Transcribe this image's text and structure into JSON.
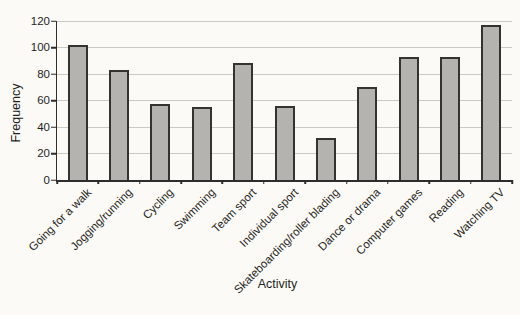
{
  "figure": {
    "background": "#fbfaf6"
  },
  "chart_data": {
    "type": "bar",
    "title": "",
    "categories": [
      "Going for a walk",
      "Jogging/running",
      "Cycling",
      "Swimming",
      "Team sport",
      "Individual sport",
      "Skateboarding/roller blading",
      "Dance or drama",
      "Computer games",
      "Reading",
      "Watching TV"
    ],
    "values": [
      102,
      83,
      57,
      55,
      88,
      56,
      32,
      70,
      93,
      93,
      117
    ],
    "xlabel": "Activity",
    "ylabel": "Frequency",
    "ylim": [
      0,
      120
    ],
    "ytick_step": 20,
    "yticks": [
      0,
      20,
      40,
      60,
      80,
      100,
      120
    ],
    "grid": true,
    "legend": "none",
    "bar_fill": "#b5b3b0",
    "bar_border": "#33332f",
    "gridline_color": "#cbc9c4",
    "axis_color": "#2e2d2b",
    "text_color": "#1f1f1d"
  }
}
